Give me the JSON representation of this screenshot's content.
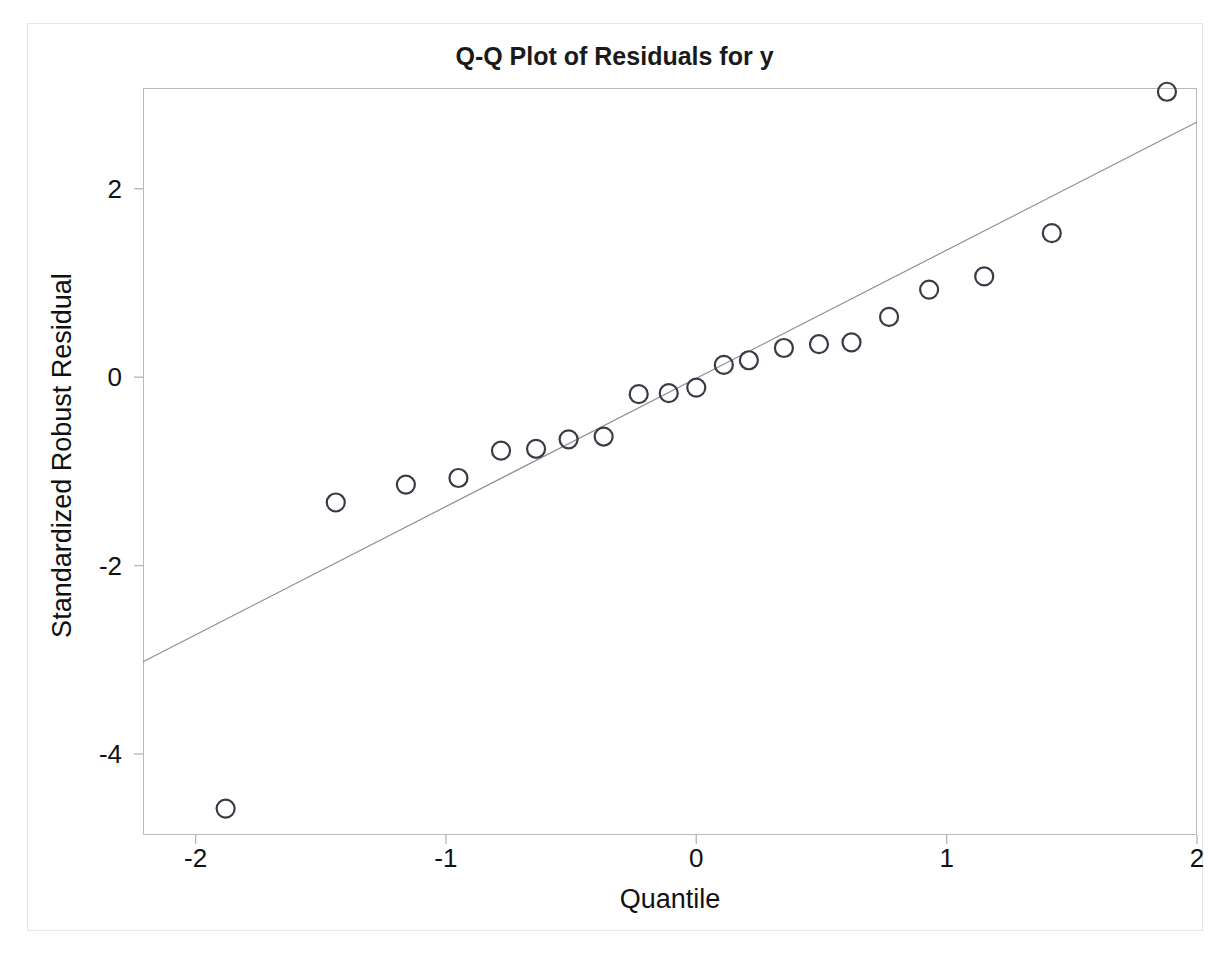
{
  "figure": {
    "title": "Q-Q Plot of Residuals for y",
    "x_axis_title": "Quantile",
    "y_axis_title": "Standardized Robust Residual"
  },
  "chart_data": {
    "type": "scatter",
    "title": "Q-Q Plot of Residuals for y",
    "xlabel": "Quantile",
    "ylabel": "Standardized Robust Residual",
    "xlim": [
      -2.21,
      2.0
    ],
    "ylim": [
      -4.86,
      3.07
    ],
    "grid": false,
    "legend": null,
    "xticks": [
      -2,
      -1,
      0,
      1,
      2
    ],
    "xtick_labels": [
      "-2",
      "-1",
      "0",
      "1",
      "2"
    ],
    "yticks": [
      2,
      0,
      -2,
      -4
    ],
    "ytick_labels": [
      "2",
      "0",
      "-2",
      "-4"
    ],
    "marker": "open-circle",
    "marker_color": "#3a3a46",
    "line_color": "#8f8f8f",
    "points": [
      {
        "x": -1.88,
        "y": -4.58
      },
      {
        "x": -1.44,
        "y": -1.33
      },
      {
        "x": -1.16,
        "y": -1.14
      },
      {
        "x": -0.95,
        "y": -1.07
      },
      {
        "x": -0.78,
        "y": -0.78
      },
      {
        "x": -0.64,
        "y": -0.76
      },
      {
        "x": -0.51,
        "y": -0.66
      },
      {
        "x": -0.37,
        "y": -0.63
      },
      {
        "x": -0.23,
        "y": -0.18
      },
      {
        "x": -0.11,
        "y": -0.17
      },
      {
        "x": 0.0,
        "y": -0.11
      },
      {
        "x": 0.11,
        "y": 0.13
      },
      {
        "x": 0.21,
        "y": 0.18
      },
      {
        "x": 0.35,
        "y": 0.31
      },
      {
        "x": 0.49,
        "y": 0.35
      },
      {
        "x": 0.62,
        "y": 0.37
      },
      {
        "x": 0.77,
        "y": 0.64
      },
      {
        "x": 0.93,
        "y": 0.93
      },
      {
        "x": 1.15,
        "y": 1.07
      },
      {
        "x": 1.42,
        "y": 1.53
      },
      {
        "x": 1.88,
        "y": 3.03
      }
    ],
    "reference_line": {
      "x0": -2.21,
      "y0": -3.02,
      "x1": 2.0,
      "y1": 2.71
    }
  }
}
